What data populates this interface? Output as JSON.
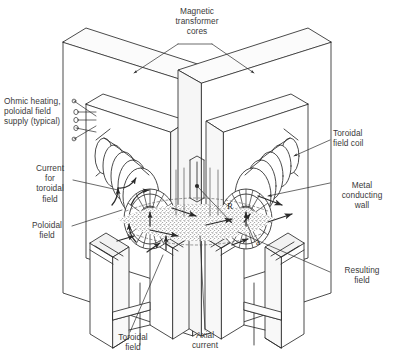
{
  "figure": {
    "background_color": "#ffffff",
    "line_color": "#2b2b2b",
    "text_color": "#3a3a3a",
    "width": 394,
    "height": 361
  },
  "labels": {
    "magnetic_transformer_cores": "Magnetic\ntransformer\ncores",
    "ohmic_heating_supply": "Ohmic heating,\npoloidal field\nsupply (typical)",
    "current_for_toroidal_field": "Current\nfor\ntoroidal\nfield",
    "poloidal_field": "Poloidal\nfield",
    "toroidal_field": "Toroidal\nfield",
    "axial_current": "Axial\ncurrent",
    "toroidal_field_coil": "Toroidal\nfield coil",
    "metal_conducting_wall": "Metal\nconducting\nwall",
    "resulting_field": "Resulting\nfield"
  },
  "symbols": {
    "major_radius": "R",
    "minor_radius": "a"
  }
}
